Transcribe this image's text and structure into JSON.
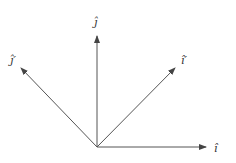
{
  "diagram": {
    "type": "basis-vectors-rotation",
    "origin": [
      97,
      147
    ],
    "colors": {
      "line": "#555555",
      "label": "#333333",
      "background": "#ffffff"
    },
    "vectors": [
      {
        "id": "i-hat",
        "label": "î",
        "end": [
          207,
          147
        ]
      },
      {
        "id": "j-hat",
        "label": "ĵ",
        "end": [
          97,
          35
        ]
      },
      {
        "id": "i-hat-prime",
        "label": "î′",
        "end": [
          176,
          67
        ]
      },
      {
        "id": "j-hat-prime",
        "label": "ĵ′",
        "end": [
          20,
          67
        ]
      }
    ]
  }
}
